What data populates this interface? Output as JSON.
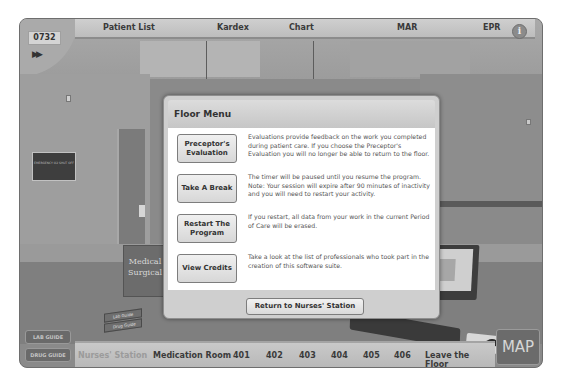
{
  "header": {
    "clock": "0732",
    "fast_forward_icon": "fast-forward-icon",
    "tabs": [
      {
        "label": "Patient List"
      },
      {
        "label": "Kardex"
      },
      {
        "label": "Chart"
      },
      {
        "label": "MAR"
      },
      {
        "label": "EPR"
      }
    ],
    "info_icon": "i"
  },
  "scene": {
    "sign_text": "EMERGENCY O2 SHUT OFF",
    "book_title": "Medical Surgical",
    "guidebook_1": "Lab Guide",
    "guidebook_2": "Drug Guide"
  },
  "modal": {
    "title": "Floor Menu",
    "items": [
      {
        "button": "Preceptor's Evaluation",
        "description": "Evaluations provide feedback on the work you completed during patient care. If you choose the Preceptor's Evaluation you will no longer be able to return to the floor."
      },
      {
        "button": "Take A Break",
        "description": "The timer will be paused until you resume the program. Note: Your session will expire after 90 minutes of inactivity and you will need to restart your activity."
      },
      {
        "button": "Restart The Program",
        "description": "If you restart, all data from your work in the current Period of Care will be erased."
      },
      {
        "button": "View Credits",
        "description": "Take a look at the list of professionals who took part in the creation of this software suite."
      }
    ],
    "return_button": "Return to Nurses' Station"
  },
  "footer": {
    "lab_guide": "LAB GUIDE",
    "drug_guide": "DRUG GUIDE",
    "locations": [
      {
        "label": "Nurses' Station",
        "current": true
      },
      {
        "label": "Medication Room"
      },
      {
        "label": "401"
      },
      {
        "label": "402"
      },
      {
        "label": "403"
      },
      {
        "label": "404"
      },
      {
        "label": "405"
      },
      {
        "label": "406"
      },
      {
        "label": "Leave the Floor"
      }
    ],
    "map_button": "MAP"
  }
}
